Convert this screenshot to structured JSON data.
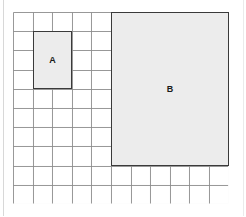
{
  "canvas": {
    "width": 246,
    "height": 217,
    "background_color": "#ffffff",
    "frame_color": "#d8d8d8"
  },
  "grid": {
    "columns": 11,
    "rows": 10,
    "origin_x": 13,
    "origin_y": 12,
    "cell_width": 19.6,
    "cell_height": 19.2,
    "line_color": "#8c8c8c",
    "line_width": 0.9
  },
  "chart_data": {
    "type": "diagram",
    "title": "",
    "grid_columns": 11,
    "grid_rows": 10,
    "shapes": [
      {
        "label": "A",
        "col_start": 1,
        "row_start": 1,
        "width_cells": 2,
        "height_cells": 3,
        "area_cells": 6,
        "perimeter_cells": 10,
        "fill": "#ececec",
        "stroke": "#3a3a3a"
      },
      {
        "label": "B",
        "col_start": 5,
        "row_start": 0,
        "width_cells": 6,
        "height_cells": 8,
        "area_cells": 48,
        "perimeter_cells": 28,
        "fill": "#ececec",
        "stroke": "#3a3a3a"
      }
    ]
  },
  "labels": {
    "a": "A",
    "b": "B"
  }
}
